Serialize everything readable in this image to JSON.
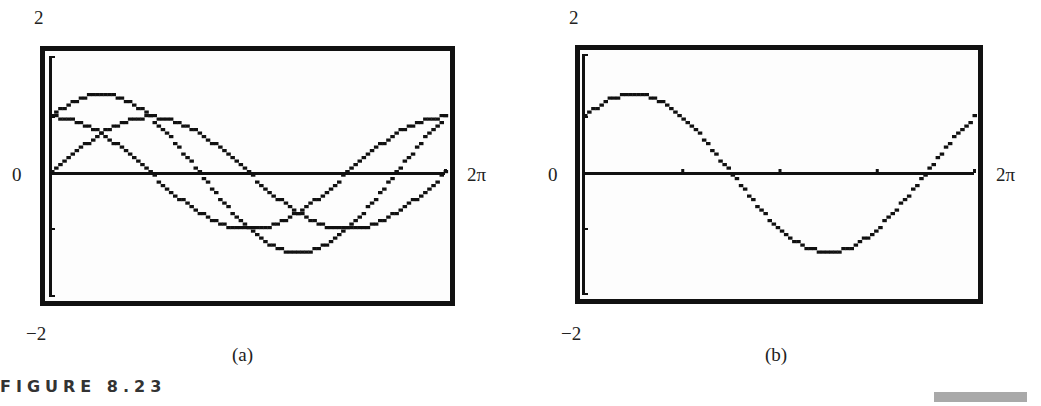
{
  "figure": {
    "title": "FIGURE 8.23"
  },
  "panels": [
    {
      "id": "a",
      "caption": "(a)",
      "ymax_label": "2",
      "ymin_label": "−2",
      "x0_label": "0",
      "xmax_label": "2π"
    },
    {
      "id": "b",
      "caption": "(b)",
      "ymax_label": "2",
      "ymin_label": "−2",
      "x0_label": "0",
      "xmax_label": "2π"
    }
  ],
  "chart_data": [
    {
      "type": "line",
      "title": "(a)",
      "xlim": [
        0,
        6.2832
      ],
      "ylim": [
        -2,
        2
      ],
      "xlabel": "",
      "ylabel": "",
      "x_tick_labels": [
        "0",
        "2π"
      ],
      "y_tick_labels": [
        "-2",
        "2"
      ],
      "grid": false,
      "series": [
        {
          "name": "y = sin x",
          "x": [
            0,
            0.785,
            1.571,
            2.356,
            3.142,
            3.927,
            4.712,
            5.498,
            6.283
          ],
          "values": [
            0,
            0.71,
            1,
            0.71,
            0,
            -0.71,
            -1,
            -0.71,
            0
          ]
        },
        {
          "name": "y = cos x",
          "x": [
            0,
            0.785,
            1.571,
            2.356,
            3.142,
            3.927,
            4.712,
            5.498,
            6.283
          ],
          "values": [
            1,
            0.71,
            0,
            -0.71,
            -1,
            -0.71,
            0,
            0.71,
            1
          ]
        },
        {
          "name": "y = sin x + cos x",
          "x": [
            0,
            0.785,
            1.571,
            2.356,
            3.142,
            3.927,
            4.712,
            5.498,
            6.283
          ],
          "values": [
            1,
            1.41,
            1,
            0,
            -1,
            -1.41,
            -1,
            0,
            1
          ]
        }
      ]
    },
    {
      "type": "line",
      "title": "(b)",
      "xlim": [
        0,
        6.2832
      ],
      "ylim": [
        -2,
        2
      ],
      "xlabel": "",
      "ylabel": "",
      "x_tick_labels": [
        "0",
        "2π"
      ],
      "y_tick_labels": [
        "-2",
        "2"
      ],
      "grid": false,
      "series": [
        {
          "name": "y = sin x + cos x",
          "x": [
            0,
            0.785,
            1.571,
            2.356,
            3.142,
            3.927,
            4.712,
            5.498,
            6.283
          ],
          "values": [
            1,
            1.41,
            1,
            0,
            -1,
            -1.41,
            -1,
            0,
            1
          ]
        }
      ]
    }
  ]
}
